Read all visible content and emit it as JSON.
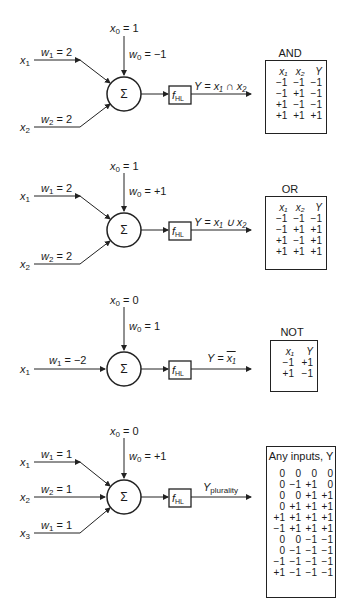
{
  "figure": {
    "panels": [
      {
        "id": "and",
        "bias_input": "x",
        "bias_input_sub": "0",
        "bias_value": " = 1",
        "bias_weight": "w",
        "bias_weight_sub": "0",
        "bias_weight_value": " = −1",
        "inputs": [
          {
            "name": "x",
            "sub": "1",
            "weight": "w",
            "weight_sub": "1",
            "weight_value": " = 2"
          },
          {
            "name": "x",
            "sub": "2",
            "weight": "w",
            "weight_sub": "2",
            "weight_value": " = 2"
          }
        ],
        "summer": "Σ",
        "activation": "f",
        "activation_sub": "HL",
        "output_label": "Y = x₁ ∩ x₂",
        "table": {
          "title": "AND",
          "headers": [
            "x₁",
            "x₂",
            "Y"
          ],
          "rows": [
            [
              "−1",
              "−1",
              "−1"
            ],
            [
              "−1",
              "+1",
              "−1"
            ],
            [
              "+1",
              "−1",
              "−1"
            ],
            [
              "+1",
              "+1",
              "+1"
            ]
          ]
        }
      },
      {
        "id": "or",
        "bias_input": "x",
        "bias_input_sub": "0",
        "bias_value": " = 1",
        "bias_weight": "w",
        "bias_weight_sub": "0",
        "bias_weight_value": " = +1",
        "inputs": [
          {
            "name": "x",
            "sub": "1",
            "weight": "w",
            "weight_sub": "1",
            "weight_value": " = 2"
          },
          {
            "name": "x",
            "sub": "2",
            "weight": "w",
            "weight_sub": "2",
            "weight_value": " = 2"
          }
        ],
        "summer": "Σ",
        "activation": "f",
        "activation_sub": "HL",
        "output_label": "Y = x₁ ∪ x₂",
        "table": {
          "title": "OR",
          "headers": [
            "x₁",
            "x₂",
            "Y"
          ],
          "rows": [
            [
              "−1",
              "−1",
              "−1"
            ],
            [
              "−1",
              "+1",
              "+1"
            ],
            [
              "+1",
              "−1",
              "+1"
            ],
            [
              "+1",
              "+1",
              "+1"
            ]
          ]
        }
      },
      {
        "id": "not",
        "bias_input": "x",
        "bias_input_sub": "0",
        "bias_value": " = 0",
        "bias_weight": "w",
        "bias_weight_sub": "0",
        "bias_weight_value": " = 1",
        "inputs": [
          {
            "name": "x",
            "sub": "1",
            "weight": "w",
            "weight_sub": "1",
            "weight_value": " = −2"
          }
        ],
        "summer": "Σ",
        "activation": "f",
        "activation_sub": "HL",
        "output_prefix": "Y = ",
        "output_overline": "x₁",
        "table": {
          "title": "NOT",
          "headers": [
            "x₁",
            "Y"
          ],
          "rows": [
            [
              "−1",
              "+1"
            ],
            [
              "+1",
              "−1"
            ]
          ]
        }
      },
      {
        "id": "plurality",
        "bias_input": "x",
        "bias_input_sub": "0",
        "bias_value": " = 0",
        "bias_weight": "w",
        "bias_weight_sub": "0",
        "bias_weight_value": " = +1",
        "inputs": [
          {
            "name": "x",
            "sub": "1",
            "weight": "w",
            "weight_sub": "1",
            "weight_value": " = 1"
          },
          {
            "name": "x",
            "sub": "2",
            "weight": "w",
            "weight_sub": "2",
            "weight_value": " = 1"
          },
          {
            "name": "x",
            "sub": "3",
            "weight": "w",
            "weight_sub": "1",
            "weight_value": " = 1"
          }
        ],
        "summer": "Σ",
        "activation": "f",
        "activation_sub": "HL",
        "output_main": "Y",
        "output_sub": "plurality",
        "table": {
          "title": "Any inputs, Y",
          "rows": [
            [
              "0",
              "0",
              "0",
              "0"
            ],
            [
              "0",
              "−1",
              "+1",
              "0"
            ],
            [
              "0",
              "0",
              "+1",
              "+1"
            ],
            [
              "0",
              "+1",
              "+1",
              "+1"
            ],
            [
              "+1",
              "+1",
              "+1",
              "+1"
            ],
            [
              "−1",
              "+1",
              "+1",
              "+1"
            ],
            [
              "0",
              "0",
              "−1",
              "−1"
            ],
            [
              "0",
              "−1",
              "−1",
              "−1"
            ],
            [
              "−1",
              "−1",
              "−1",
              "−1"
            ],
            [
              "+1",
              "−1",
              "−1",
              "−1"
            ]
          ]
        }
      }
    ]
  }
}
